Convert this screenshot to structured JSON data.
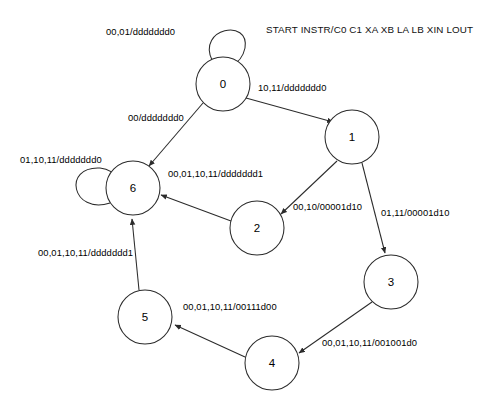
{
  "diagram": {
    "title": "START INSTR/C0 C1 XA XB LA LB XIN LOUT",
    "type": "finite-state-machine",
    "states": [
      {
        "id": "0",
        "label": "0",
        "cx": 223,
        "cy": 84,
        "r": 27
      },
      {
        "id": "1",
        "label": "1",
        "cx": 352,
        "cy": 137,
        "r": 27
      },
      {
        "id": "2",
        "label": "2",
        "cx": 257,
        "cy": 228,
        "r": 27
      },
      {
        "id": "3",
        "label": "3",
        "cx": 391,
        "cy": 282,
        "r": 27
      },
      {
        "id": "4",
        "label": "4",
        "cx": 272,
        "cy": 363,
        "r": 27
      },
      {
        "id": "5",
        "label": "5",
        "cx": 145,
        "cy": 317,
        "r": 27
      },
      {
        "id": "6",
        "label": "6",
        "cx": 133,
        "cy": 188,
        "r": 27
      }
    ],
    "transitions": [
      {
        "from": "0",
        "to": "0",
        "label": "00,01/ddddddd0",
        "kind": "self-loop-top",
        "label_x": 106,
        "label_y": 26
      },
      {
        "from": "0",
        "to": "1",
        "label": "10,11/ddddddd0",
        "kind": "edge",
        "label_x": 258,
        "label_y": 82
      },
      {
        "from": "0",
        "to": "6",
        "label": "00/ddddddd0",
        "kind": "edge",
        "label_x": 128,
        "label_y": 112
      },
      {
        "from": "1",
        "to": "2",
        "label": "00,10/00001d10",
        "kind": "edge",
        "label_x": 293,
        "label_y": 201
      },
      {
        "from": "1",
        "to": "3",
        "label": "01,11/00001d10",
        "kind": "edge",
        "label_x": 381,
        "label_y": 207
      },
      {
        "from": "2",
        "to": "6",
        "label": "00,01,10,11/ddddddd1",
        "kind": "edge",
        "label_x": 168,
        "label_y": 168
      },
      {
        "from": "6",
        "to": "6",
        "label": "01,10,11/ddddddd0",
        "kind": "self-loop-left",
        "label_x": 20,
        "label_y": 154
      },
      {
        "from": "3",
        "to": "4",
        "label": "00,01,10,11/001001d0",
        "kind": "edge",
        "label_x": 322,
        "label_y": 337
      },
      {
        "from": "4",
        "to": "5",
        "label": "00,01,10,11/00111d00",
        "kind": "edge",
        "label_x": 183,
        "label_y": 301
      },
      {
        "from": "5",
        "to": "6",
        "label": "00,01,10,11/ddddddd1",
        "kind": "edge",
        "label_x": 38,
        "label_y": 247
      }
    ]
  }
}
